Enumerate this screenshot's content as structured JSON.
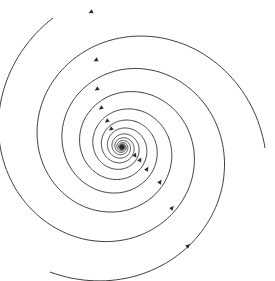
{
  "diagram": {
    "type": "phase-portrait",
    "width": 275,
    "height": 281,
    "background": "#ffffff",
    "stroke_color": "#2a2a2a",
    "center": {
      "x": 122,
      "y": 147
    },
    "fixed_point": {
      "label": "",
      "kind": "stable-focus"
    },
    "trajectories": [
      {
        "id": "spiral-a",
        "end_point": {
          "x": 53,
          "y": 18
        },
        "direction": "counterclockwise-inward"
      },
      {
        "id": "spiral-b",
        "end_point": {
          "x": 265,
          "y": 148
        },
        "direction": "counterclockwise-inward"
      },
      {
        "id": "spiral-c",
        "end_point": {
          "x": 50,
          "y": 272
        },
        "direction": "counterclockwise-inward"
      }
    ],
    "arrows": [
      {
        "x": 91,
        "y": 12
      },
      {
        "x": 96,
        "y": 60
      },
      {
        "x": 97,
        "y": 89
      },
      {
        "x": 101,
        "y": 108
      },
      {
        "x": 107,
        "y": 121
      },
      {
        "x": 111,
        "y": 129
      },
      {
        "x": 135,
        "y": 155
      },
      {
        "x": 140,
        "y": 160
      },
      {
        "x": 147,
        "y": 169
      },
      {
        "x": 160,
        "y": 182
      },
      {
        "x": 172,
        "y": 208
      },
      {
        "x": 188,
        "y": 246
      }
    ]
  }
}
